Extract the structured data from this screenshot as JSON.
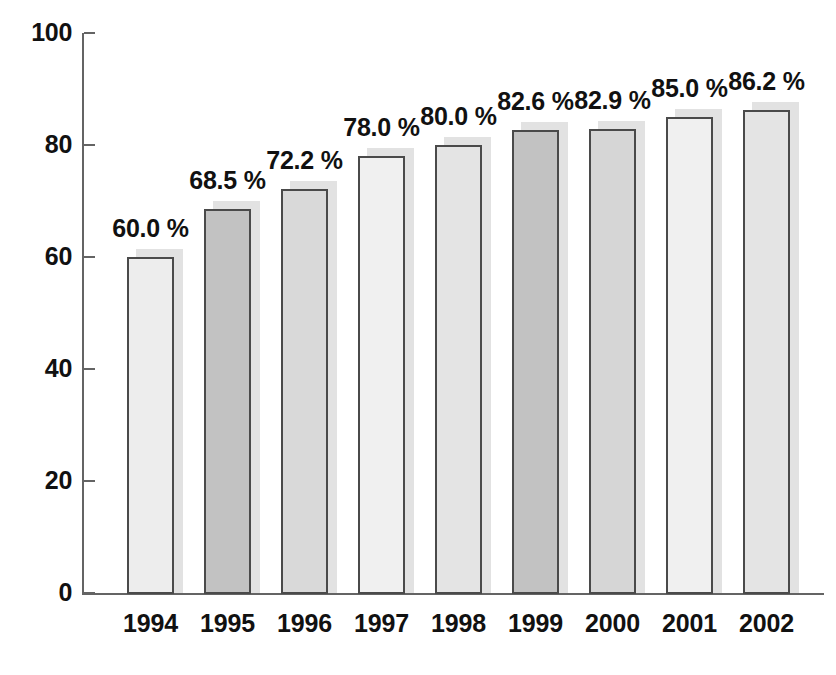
{
  "chart_data": {
    "type": "bar",
    "title": "",
    "subtitle": "",
    "xlabel": "",
    "ylabel": "",
    "categories": [
      "1994",
      "1995",
      "1996",
      "1997",
      "1998",
      "1999",
      "2000",
      "2001",
      "2002"
    ],
    "values": [
      60.0,
      68.5,
      72.2,
      78.0,
      80.0,
      82.6,
      82.9,
      85.0,
      86.2
    ],
    "data_labels": [
      "60.0 %",
      "68.5 %",
      "72.2 %",
      "78.0 %",
      "80.0 %",
      "82.6 %",
      "82.9 %",
      "85.0 %",
      "86.2 %"
    ],
    "bar_colors": [
      "#ededed",
      "#c2c2c2",
      "#d9d9d9",
      "#f0f0f0",
      "#e4e4e4",
      "#c2c2c2",
      "#d6d6d6",
      "#f0f0f0",
      "#e4e4e4"
    ],
    "bar_border_color": "#4a4a4a",
    "bar_shadow_color": "#e2e2e2",
    "axis_color": "#646464",
    "text_color": "#111111",
    "background": "#ffffff",
    "ylim": [
      0,
      100
    ],
    "yticks": [
      0,
      20,
      40,
      60,
      80,
      100
    ],
    "ytick_labels": [
      "0",
      "20",
      "40",
      "60",
      "80",
      "100"
    ],
    "grid": false,
    "legend": "none",
    "value_suffix": "%"
  }
}
